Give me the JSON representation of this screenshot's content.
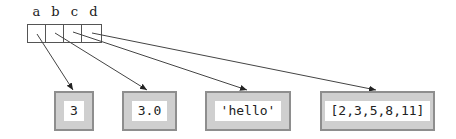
{
  "diagram": {
    "variables": [
      {
        "name": "a",
        "points_to": 0
      },
      {
        "name": "b",
        "points_to": 1
      },
      {
        "name": "c",
        "points_to": 2
      },
      {
        "name": "d",
        "points_to": 3
      }
    ],
    "objects": [
      {
        "value": "3"
      },
      {
        "value": "3.0"
      },
      {
        "value": "'hello'"
      },
      {
        "value": "[2,3,5,8,11]"
      }
    ],
    "colors": {
      "object_fill": "#cfcfcf",
      "object_border": "#8e8e8e",
      "value_bg": "#ffffff",
      "line": "#444444"
    }
  }
}
